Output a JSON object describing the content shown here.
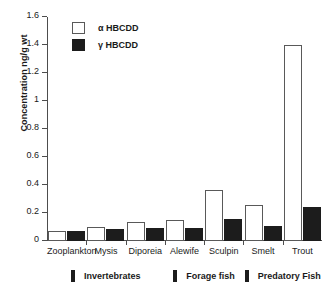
{
  "chart_data": {
    "type": "bar",
    "title": "",
    "xlabel": "",
    "ylabel": "Concentration ng/g wt",
    "ylim": [
      0,
      1.6
    ],
    "ytick_labels": [
      "0",
      "0.2",
      "0.4",
      "0.6",
      "0.8",
      "1",
      "1.2",
      "1.4",
      "1.6"
    ],
    "ytick_values": [
      0,
      0.2,
      0.4,
      0.6,
      0.8,
      1.0,
      1.2,
      1.4,
      1.6
    ],
    "grid": false,
    "legend_position": "top-left",
    "categories": [
      "Zooplankton",
      "Mysis",
      "Diporeia",
      "Alewife",
      "Sculpin",
      "Smelt",
      "Trout"
    ],
    "series": [
      {
        "name": "α HBCDD",
        "color": "#ffffff",
        "edge_color": "#595959",
        "values": [
          0.075,
          0.1,
          0.135,
          0.15,
          0.365,
          0.255,
          1.4
        ]
      },
      {
        "name": "γ HBCDD",
        "color": "#1c1c1c",
        "edge_color": "#1c1c1c",
        "values": [
          0.075,
          0.085,
          0.095,
          0.095,
          0.155,
          0.11,
          0.245
        ]
      }
    ],
    "groups": [
      {
        "label": "Invertebrates",
        "categories": [
          "Zooplankton",
          "Mysis",
          "Diporeia"
        ]
      },
      {
        "label": "Forage fish",
        "categories": [
          "Alewife",
          "Sculpin"
        ]
      },
      {
        "label": "Predatory Fish",
        "categories": [
          "Smelt",
          "Trout"
        ]
      }
    ]
  },
  "legend": {
    "items": [
      {
        "label": "α HBCDD"
      },
      {
        "label": "γ HBCDD"
      }
    ]
  },
  "axes": {
    "y_title": "Concentration ng/g wt"
  }
}
